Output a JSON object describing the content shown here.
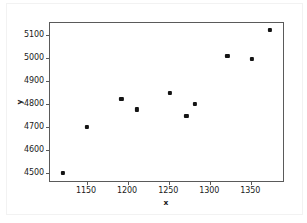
{
  "chart_data": {
    "type": "scatter",
    "title": "",
    "xlabel": "x",
    "ylabel": "y",
    "xlim": [
      1105,
      1391
    ],
    "ylim": [
      4455,
      5150
    ],
    "xticks": [
      1150,
      1200,
      1250,
      1300,
      1350
    ],
    "yticks": [
      4500,
      4600,
      4700,
      4800,
      4900,
      5000,
      5100
    ],
    "xtick_labels": [
      "1150",
      "1200",
      "1250",
      "1300",
      "1350"
    ],
    "ytick_labels": [
      "4500",
      "4600",
      "4700",
      "4800",
      "4900",
      "5000",
      "5100"
    ],
    "grid": false,
    "legend": false,
    "marker_color": "#141414",
    "marker_style": "square",
    "axes_color": "#5a5a5a",
    "background_color": "#ffffff",
    "points": [
      {
        "x": 1121,
        "y": 4500
      },
      {
        "x": 1150,
        "y": 4700
      },
      {
        "x": 1192,
        "y": 4820
      },
      {
        "x": 1211,
        "y": 4775
      },
      {
        "x": 1251,
        "y": 4848
      },
      {
        "x": 1271,
        "y": 4748
      },
      {
        "x": 1281,
        "y": 4798
      },
      {
        "x": 1321,
        "y": 5008
      },
      {
        "x": 1351,
        "y": 4995
      },
      {
        "x": 1373,
        "y": 5120
      }
    ]
  }
}
